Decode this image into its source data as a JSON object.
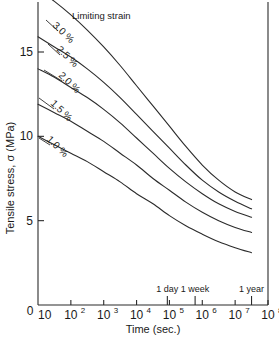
{
  "chart_data": {
    "type": "line",
    "title": "",
    "xlabel": "Time (sec.)",
    "ylabel": "Tensile stress, σ (MPa)",
    "legend_title": "Limiting strain",
    "legend_position": "inline-curve-labels",
    "grid": false,
    "x_scale": "log",
    "xlim": [
      10,
      100000000
    ],
    "ylim": [
      0,
      18
    ],
    "y_ticks": [
      5,
      10,
      15
    ],
    "y_tick_labels": [
      "5",
      "10",
      "15"
    ],
    "origin_label": "0",
    "x_ticks": [
      10,
      100,
      1000,
      10000,
      100000,
      1000000,
      10000000,
      100000000
    ],
    "x_tick_labels": [
      {
        "base": "10",
        "exp": ""
      },
      {
        "base": "10",
        "exp": "2"
      },
      {
        "base": "10",
        "exp": "3"
      },
      {
        "base": "10",
        "exp": "4"
      },
      {
        "base": "10",
        "exp": "5"
      },
      {
        "base": "10",
        "exp": "6"
      },
      {
        "base": "10",
        "exp": "7"
      },
      {
        "base": "10",
        "exp": "8"
      }
    ],
    "annotations": [
      {
        "label": "1 day",
        "x": 86400
      },
      {
        "label": "1 week",
        "x": 604800
      },
      {
        "label": "1 year",
        "x": 31536000
      }
    ],
    "series": [
      {
        "name": "3.0 %",
        "label": "3.0 %",
        "x": [
          10,
          31.6,
          100,
          316,
          1000,
          3160,
          10000,
          31600,
          100000,
          316000,
          1000000,
          3160000,
          10000000,
          31600000
        ],
        "y": [
          18.7,
          18.0,
          17.2,
          16.3,
          15.3,
          14.2,
          13.0,
          11.8,
          10.6,
          9.4,
          8.3,
          7.4,
          6.7,
          6.25
        ]
      },
      {
        "name": "2.5 %",
        "label": "2.5 %",
        "x": [
          10,
          31.6,
          100,
          316,
          1000,
          3160,
          10000,
          31600,
          100000,
          316000,
          1000000,
          3160000,
          10000000,
          31600000
        ],
        "y": [
          15.9,
          15.3,
          14.7,
          14.0,
          13.2,
          12.3,
          11.3,
          10.3,
          9.3,
          8.3,
          7.4,
          6.7,
          6.15,
          5.7
        ]
      },
      {
        "name": "2.0 %",
        "label": "2.0 %",
        "x": [
          10,
          31.6,
          100,
          316,
          1000,
          3160,
          10000,
          31600,
          100000,
          316000,
          1000000,
          3160000,
          10000000,
          31600000
        ],
        "y": [
          14.0,
          13.5,
          12.9,
          12.3,
          11.6,
          10.8,
          9.9,
          9.0,
          8.1,
          7.3,
          6.6,
          6.0,
          5.55,
          5.2
        ]
      },
      {
        "name": "1.5 %",
        "label": "1.5 %",
        "x": [
          10,
          31.6,
          100,
          316,
          1000,
          3160,
          10000,
          31600,
          100000,
          316000,
          1000000,
          3160000,
          10000000,
          31600000
        ],
        "y": [
          11.9,
          11.4,
          10.9,
          10.3,
          9.7,
          9.0,
          8.3,
          7.5,
          6.8,
          6.1,
          5.5,
          5.0,
          4.6,
          4.3
        ]
      },
      {
        "name": "1.0 %",
        "label": "1.0 %",
        "x": [
          10,
          31.6,
          100,
          316,
          1000,
          3160,
          10000,
          31600,
          100000,
          316000,
          1000000,
          3160000,
          10000000,
          31600000
        ],
        "y": [
          10.0,
          9.5,
          9.0,
          8.5,
          7.9,
          7.3,
          6.6,
          6.0,
          5.3,
          4.7,
          4.2,
          3.75,
          3.4,
          3.1
        ]
      }
    ]
  }
}
